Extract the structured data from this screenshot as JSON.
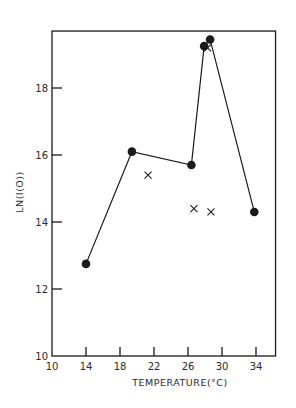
{
  "chart_data": {
    "type": "line",
    "title": "",
    "xlabel": "TEMPERATURE(°C)",
    "ylabel": "LN(I(O))",
    "xlim": [
      10,
      36.3
    ],
    "ylim": [
      10,
      19.7
    ],
    "xticks": [
      10,
      14,
      18,
      22,
      26,
      30,
      34
    ],
    "yticks": [
      10,
      12,
      14,
      16,
      18
    ],
    "grid": false,
    "legend": null,
    "series": [
      {
        "name": "filled circles (connected)",
        "marker": "circle",
        "connected": true,
        "x": [
          14.0,
          19.4,
          26.4,
          27.9,
          28.6,
          33.8
        ],
        "y": [
          12.75,
          16.1,
          15.7,
          19.25,
          19.45,
          14.3
        ]
      },
      {
        "name": "crosses",
        "marker": "x",
        "connected": false,
        "x": [
          21.3,
          26.7,
          28.3,
          28.7
        ],
        "y": [
          15.4,
          14.4,
          19.2,
          14.3
        ]
      }
    ]
  },
  "colors": {
    "ink": "#1a1a1a",
    "background": "#ffffff"
  }
}
